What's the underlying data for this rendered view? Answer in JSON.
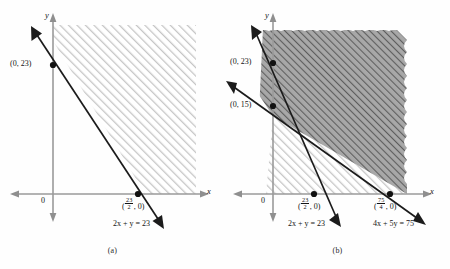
{
  "figure": {
    "type": "linear-inequality-graphs",
    "panels": [
      {
        "caption": "(a)",
        "axis_x_label": "x",
        "axis_y_label": "y",
        "origin_label": "0",
        "points": [
          {
            "name": "y-intercept",
            "label_text": "(0, 23)",
            "value_x": 0,
            "value_y": 23
          },
          {
            "name": "x-intercept",
            "label_prefix": "(",
            "label_suffix": ", 0)",
            "frac_num": "23",
            "frac_den": "2",
            "value_x": 11.5,
            "value_y": 0
          }
        ],
        "lines": [
          {
            "name": "line-2x-plus-y-23",
            "equation_lhs": "2x + y",
            "equation_rhs": "23",
            "equation_text": "2x + y = 23",
            "slope": -2,
            "y_intercept": 23
          }
        ],
        "shading": {
          "style": "light-diagonal-hatch",
          "region": "above-line-right"
        }
      },
      {
        "caption": "(b)",
        "axis_x_label": "x",
        "axis_y_label": "y",
        "origin_label": "0",
        "points": [
          {
            "name": "y-intercept-23",
            "label_text": "(0, 23)",
            "value_x": 0,
            "value_y": 23
          },
          {
            "name": "y-intercept-15",
            "label_text": "(0, 15)",
            "value_x": 0,
            "value_y": 15
          },
          {
            "name": "x-intercept-23-2",
            "label_prefix": "(",
            "label_suffix": ", 0)",
            "frac_num": "23",
            "frac_den": "2",
            "value_x": 11.5,
            "value_y": 0
          },
          {
            "name": "x-intercept-75-4",
            "label_prefix": "(",
            "label_suffix": ", 0)",
            "frac_num": "75",
            "frac_den": "4",
            "value_x": 18.75,
            "value_y": 0
          }
        ],
        "lines": [
          {
            "name": "line-2x-plus-y-23",
            "equation_text": "2x + y = 23",
            "slope": -2,
            "y_intercept": 23
          },
          {
            "name": "line-4x-plus-5y-75",
            "equation_text": "4x + 5y = 75",
            "slope": -0.8,
            "y_intercept": 15
          }
        ],
        "shading": {
          "style": "dark-diagonal-hatch-over-light",
          "region": "feasible-intersection"
        }
      }
    ]
  },
  "colors": {
    "ink": "#141414",
    "axis": "#8a8a8a",
    "light_hatch": "#c9c9c9",
    "dark_hatch": "#6f6f6f",
    "dark_fill": "#9a9a9a",
    "background": "#fefefe"
  }
}
